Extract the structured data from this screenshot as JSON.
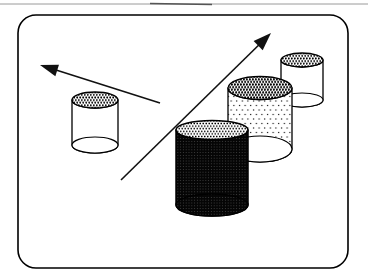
{
  "figure": {
    "background_color": "#ffffff",
    "outline_color": "#000000",
    "frame": {
      "x": 18,
      "y": 15,
      "width": 330,
      "height": 253,
      "corner_radius": 18,
      "stroke_color": "#000000",
      "stroke_width": 1.6,
      "fill_color": "#ffffff"
    },
    "artifact_line": {
      "y": 4,
      "color": "#9a9a9a"
    },
    "arrows": [
      {
        "name": "arrow-up-left",
        "direction": "up-left",
        "tail_x": 160,
        "tail_y": 103,
        "tip_x": 40,
        "tip_y": 65,
        "head_length": 18,
        "head_half_width": 6,
        "stroke_width": 1.6,
        "color": "#111111"
      },
      {
        "name": "arrow-up-right",
        "direction": "up-right",
        "tail_x": 121,
        "tail_y": 180,
        "tip_x": 271,
        "tip_y": 33,
        "head_length": 18,
        "head_half_width": 6.5,
        "stroke_width": 1.6,
        "color": "#111111"
      }
    ],
    "cylinders": [
      {
        "name": "cylinder-left",
        "cx": 95,
        "rx": 23,
        "top_cy": 100,
        "top_ry": 8,
        "bottom_cy": 145,
        "bottom_ry": 8,
        "top_fill": "fine-halftone",
        "body_fill": "white",
        "bottom_fill": "white",
        "stroke_width": 1.3
      },
      {
        "name": "cylinder-back-right",
        "cx": 302,
        "rx": 21,
        "top_cy": 60,
        "top_ry": 7,
        "bottom_cy": 100,
        "bottom_ry": 7,
        "top_fill": "fine-halftone",
        "body_fill": "white",
        "bottom_fill": "white",
        "stroke_width": 1.3
      },
      {
        "name": "cylinder-dotted",
        "cx": 260,
        "rx": 32,
        "top_cy": 88,
        "top_ry": 11.5,
        "bottom_cy": 149,
        "bottom_ry": 13,
        "top_fill": "med-halftone",
        "body_fill": "sparse-dots",
        "bottom_fill": "white",
        "stroke_width": 1.3
      },
      {
        "name": "cylinder-black",
        "cx": 212,
        "rx": 36,
        "top_cy": 130,
        "top_ry": 9.5,
        "bottom_cy": 205,
        "bottom_ry": 11,
        "top_fill": "light-halftone",
        "body_fill": "dark-texture",
        "bottom_fill": "dark-texture",
        "stroke_width": 1.5
      }
    ]
  }
}
